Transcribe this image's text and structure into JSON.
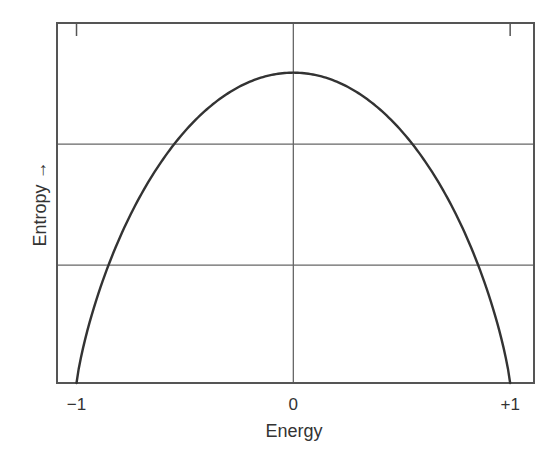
{
  "chart_data": {
    "type": "line",
    "title": "",
    "xlabel": "Energy",
    "ylabel": "Entropy →",
    "x_ticks": [
      {
        "value": -1,
        "label": "−1"
      },
      {
        "value": 0,
        "label": "0"
      },
      {
        "value": 1,
        "label": "+1"
      }
    ],
    "y_ticks": [],
    "xlim": [
      -1.09,
      1.11
    ],
    "ylim": [
      0,
      1.16
    ],
    "grid": {
      "vertical_lines_x": [
        0
      ],
      "horizontal_lines_y": [
        0.77,
        0.38
      ],
      "top_tick_marks_x": [
        -1,
        1
      ]
    },
    "legend": null,
    "series": [
      {
        "name": "Entropy (normalized)",
        "x": [
          -1.0,
          -0.95,
          -0.9,
          -0.8,
          -0.7,
          -0.6,
          -0.55,
          -0.5,
          -0.4,
          -0.3,
          -0.2,
          -0.1,
          0.0,
          0.1,
          0.2,
          0.3,
          0.4,
          0.5,
          0.55,
          0.6,
          0.7,
          0.8,
          0.9,
          0.95,
          1.0
        ],
        "values": [
          0.0,
          0.17,
          0.29,
          0.47,
          0.61,
          0.72,
          0.77,
          0.81,
          0.88,
          0.93,
          0.97,
          0.99,
          1.0,
          0.99,
          0.97,
          0.93,
          0.88,
          0.81,
          0.77,
          0.72,
          0.61,
          0.47,
          0.29,
          0.17,
          0.0
        ]
      }
    ],
    "colors": {
      "curve": "#333333",
      "frame": "#555555",
      "grid": "#666666",
      "text": "#333333"
    }
  }
}
